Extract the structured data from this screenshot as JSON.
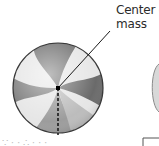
{
  "figure": {
    "label_line1": "Center of",
    "label_line2": "mass",
    "bottom_caption_fragment": "∵ · · ∴ · · ·",
    "colors": {
      "dark_panel": "#6e6e6e",
      "light_panel": "#e8e8e8",
      "mid_panel": "#9a9a9a",
      "outline": "#3a3a3a",
      "pointer": "#1a1a1a"
    }
  }
}
